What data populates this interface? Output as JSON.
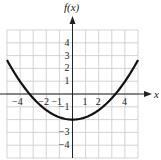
{
  "chart_data": {
    "type": "line",
    "title": "",
    "xlabel": "x",
    "ylabel": "f(x)",
    "xlim": [
      -5,
      5
    ],
    "ylim": [
      -5,
      5
    ],
    "grid": true,
    "x_tick_labels": [
      "−4",
      "−2",
      "−1",
      "1",
      "2",
      "4"
    ],
    "x_tick_values": [
      -4,
      -2,
      -1,
      1,
      2,
      4
    ],
    "y_tick_labels": [
      "4",
      "3",
      "2",
      "1",
      "−1",
      "−3",
      "−4"
    ],
    "y_tick_values": [
      4,
      3,
      2,
      1,
      -1,
      -3,
      -4
    ],
    "series": [
      {
        "name": "f(x)",
        "description": "upward-opening parabola, vertex (0, -2), x-intercepts near ±3.2",
        "x": [
          -5,
          -4,
          -3,
          -2,
          -1,
          0,
          1,
          2,
          3,
          4,
          5
        ],
        "y": [
          2.65,
          0.98,
          -0.33,
          -1.26,
          -1.81,
          -2,
          -1.81,
          -1.26,
          -0.33,
          0.98,
          2.65
        ]
      }
    ]
  },
  "labels": {
    "y_axis": "f(x)",
    "x_axis": "x"
  }
}
